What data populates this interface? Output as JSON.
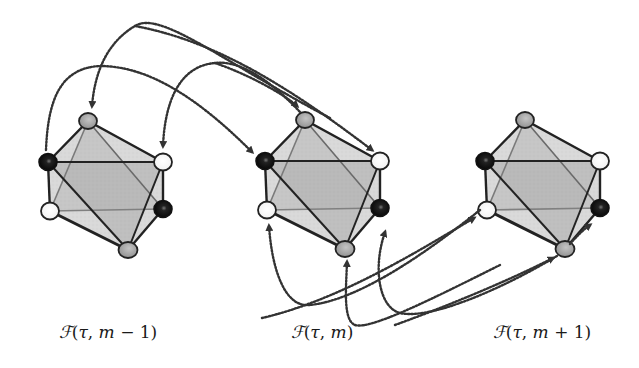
{
  "figure": {
    "colors": {
      "outer_fill": "#d6d6d6",
      "inner_fill": "#b8b8b8",
      "edge": "#222222",
      "inner_edge": "#6e6e6e",
      "arrow": "#333333",
      "node_black": "#111111",
      "node_white": "#ffffff",
      "node_gray": "#9a9a9a"
    },
    "frames": [
      {
        "id": "m-1",
        "label": "ℱ(τ, m − 1)",
        "label_parts": {
          "calF": "ℱ",
          "open": "(",
          "tau": "τ",
          "comma": ", ",
          "m": "m",
          "rest": " − 1)"
        },
        "label_x": 108,
        "offset_x": 0
      },
      {
        "id": "m",
        "label": "ℱ(τ, m)",
        "label_parts": {
          "calF": "ℱ",
          "open": "(",
          "tau": "τ",
          "comma": ", ",
          "m": "m",
          "rest": ")"
        },
        "label_x": 322,
        "offset_x": 217
      },
      {
        "id": "m+1",
        "label": "ℱ(τ, m + 1)",
        "label_parts": {
          "calF": "ℱ",
          "open": "(",
          "tau": "τ",
          "comma": ", ",
          "m": "m",
          "rest": " + 1)"
        },
        "label_x": 542,
        "offset_x": 437
      }
    ],
    "vertices": [
      {
        "name": "top",
        "x": 88,
        "y": 121,
        "color": "gray"
      },
      {
        "name": "upper-left",
        "x": 48,
        "y": 162,
        "color": "black"
      },
      {
        "name": "upper-right",
        "x": 163,
        "y": 162,
        "color": "white"
      },
      {
        "name": "lower-left",
        "x": 50,
        "y": 211,
        "color": "white"
      },
      {
        "name": "lower-right",
        "x": 163,
        "y": 209,
        "color": "black"
      },
      {
        "name": "bottom",
        "x": 128,
        "y": 250,
        "color": "gray"
      }
    ]
  }
}
